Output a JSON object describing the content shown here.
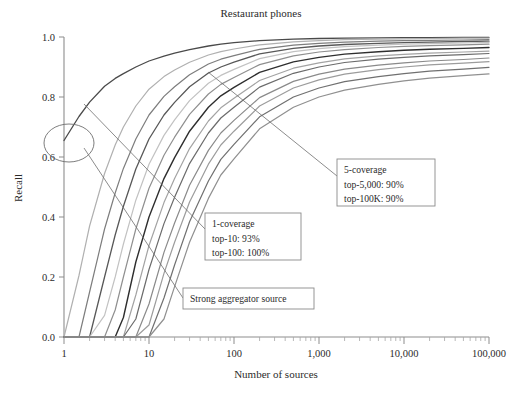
{
  "chart_data": {
    "type": "line",
    "title": "Restaurant phones",
    "xlabel": "Number of sources",
    "ylabel": "Recall",
    "xscale": "log",
    "xlim": [
      1,
      100000
    ],
    "ylim": [
      0.0,
      1.0
    ],
    "grid": false,
    "legend": "none",
    "xticks": [
      1,
      10,
      100,
      1000,
      10000,
      100000
    ],
    "xtick_labels": [
      "1",
      "10",
      "100",
      "1,000",
      "10,000",
      "100,000"
    ],
    "yticks": [
      0.0,
      0.2,
      0.4,
      0.6,
      0.8,
      1.0
    ],
    "ytick_labels": [
      "0.0",
      "0.2",
      "0.4",
      "0.6",
      "0.8",
      "1.0"
    ],
    "x": [
      1,
      1.5,
      2,
      3,
      4,
      5,
      7,
      10,
      15,
      20,
      30,
      50,
      70,
      100,
      200,
      500,
      1000,
      2000,
      5000,
      10000,
      20000,
      50000,
      100000
    ],
    "series": [
      {
        "name": "1-coverage",
        "color": "#4a4a4a",
        "width": 1.3,
        "values": [
          0.655,
          0.735,
          0.783,
          0.836,
          0.862,
          0.878,
          0.9,
          0.92,
          0.936,
          0.946,
          0.958,
          0.97,
          0.976,
          0.981,
          0.988,
          0.993,
          0.995,
          0.996,
          0.997,
          0.998,
          0.998,
          0.999,
          0.999
        ]
      },
      {
        "name": "2-coverage",
        "color": "#b0b0b0",
        "width": 1.2,
        "values": [
          0.0,
          0.205,
          0.37,
          0.545,
          0.64,
          0.7,
          0.77,
          0.826,
          0.868,
          0.89,
          0.916,
          0.94,
          0.951,
          0.96,
          0.974,
          0.984,
          0.988,
          0.991,
          0.993,
          0.994,
          0.995,
          0.996,
          0.996
        ]
      },
      {
        "name": "3-coverage",
        "color": "#7d7d7d",
        "width": 1.2,
        "values": [
          0.0,
          0.0,
          0.15,
          0.36,
          0.48,
          0.562,
          0.66,
          0.74,
          0.802,
          0.834,
          0.874,
          0.91,
          0.926,
          0.938,
          0.959,
          0.973,
          0.979,
          0.983,
          0.986,
          0.988,
          0.989,
          0.99,
          0.991
        ]
      },
      {
        "name": "4-coverage",
        "color": "#585858",
        "width": 1.3,
        "values": [
          0.0,
          0.0,
          0.0,
          0.2,
          0.34,
          0.436,
          0.56,
          0.66,
          0.74,
          0.782,
          0.834,
          0.88,
          0.9,
          0.916,
          0.944,
          0.962,
          0.97,
          0.975,
          0.979,
          0.981,
          0.983,
          0.985,
          0.986
        ]
      },
      {
        "name": "5-coverage",
        "color": "#c2c2c2",
        "width": 1.2,
        "values": [
          0.0,
          0.0,
          0.0,
          0.072,
          0.2,
          0.31,
          0.456,
          0.576,
          0.672,
          0.724,
          0.788,
          0.846,
          0.872,
          0.892,
          0.928,
          0.951,
          0.961,
          0.968,
          0.973,
          0.976,
          0.978,
          0.98,
          0.982
        ]
      },
      {
        "name": "6-coverage",
        "color": "#8f8f8f",
        "width": 1.2,
        "values": [
          0.0,
          0.0,
          0.0,
          0.0,
          0.09,
          0.2,
          0.36,
          0.496,
          0.606,
          0.666,
          0.742,
          0.81,
          0.842,
          0.865,
          0.908,
          0.937,
          0.95,
          0.958,
          0.965,
          0.969,
          0.971,
          0.974,
          0.976
        ]
      },
      {
        "name": "7-coverage",
        "color": "#2e2e2e",
        "width": 1.4,
        "values": [
          0.0,
          0.0,
          0.0,
          0.0,
          0.0,
          0.065,
          0.25,
          0.4,
          0.528,
          0.598,
          0.686,
          0.766,
          0.804,
          0.832,
          0.882,
          0.917,
          0.932,
          0.943,
          0.951,
          0.956,
          0.959,
          0.962,
          0.965
        ]
      },
      {
        "name": "8-coverage",
        "color": "#a3a3a3",
        "width": 1.2,
        "values": [
          0.0,
          0.0,
          0.0,
          0.0,
          0.0,
          0.0,
          0.14,
          0.305,
          0.448,
          0.528,
          0.628,
          0.72,
          0.764,
          0.796,
          0.855,
          0.896,
          0.914,
          0.927,
          0.937,
          0.942,
          0.946,
          0.95,
          0.953
        ]
      },
      {
        "name": "9-coverage",
        "color": "#6b6b6b",
        "width": 1.2,
        "values": [
          0.0,
          0.0,
          0.0,
          0.0,
          0.0,
          0.0,
          0.06,
          0.225,
          0.378,
          0.466,
          0.578,
          0.68,
          0.73,
          0.766,
          0.833,
          0.879,
          0.9,
          0.915,
          0.926,
          0.932,
          0.937,
          0.941,
          0.945
        ]
      },
      {
        "name": "10-coverage",
        "color": "#8a8a8a",
        "width": 1.2,
        "values": [
          0.0,
          0.0,
          0.0,
          0.0,
          0.0,
          0.0,
          0.0,
          0.11,
          0.282,
          0.38,
          0.506,
          0.622,
          0.68,
          0.722,
          0.798,
          0.852,
          0.876,
          0.893,
          0.906,
          0.914,
          0.92,
          0.925,
          0.93
        ]
      },
      {
        "name": "11-coverage",
        "color": "#9c9c9c",
        "width": 1.2,
        "values": [
          0.0,
          0.0,
          0.0,
          0.0,
          0.0,
          0.0,
          0.0,
          0.04,
          0.212,
          0.316,
          0.45,
          0.576,
          0.64,
          0.686,
          0.77,
          0.83,
          0.857,
          0.876,
          0.891,
          0.9,
          0.907,
          0.913,
          0.918
        ]
      },
      {
        "name": "12-coverage",
        "color": "#707070",
        "width": 1.2,
        "values": [
          0.0,
          0.0,
          0.0,
          0.0,
          0.0,
          0.0,
          0.0,
          0.0,
          0.13,
          0.24,
          0.384,
          0.52,
          0.592,
          0.642,
          0.734,
          0.8,
          0.83,
          0.851,
          0.868,
          0.878,
          0.886,
          0.893,
          0.899
        ]
      },
      {
        "name": "13-coverage",
        "color": "#909090",
        "width": 1.2,
        "values": [
          0.0,
          0.0,
          0.0,
          0.0,
          0.0,
          0.0,
          0.0,
          0.0,
          0.06,
          0.168,
          0.316,
          0.462,
          0.54,
          0.594,
          0.694,
          0.766,
          0.8,
          0.823,
          0.842,
          0.854,
          0.863,
          0.871,
          0.877
        ]
      }
    ],
    "annotations": [
      {
        "id": "one-coverage",
        "lines": [
          "1-coverage",
          "top-10: 93%",
          "top-100: 100%"
        ],
        "box": {
          "x": 205,
          "y": 213,
          "w": 96,
          "h": 47
        },
        "leader": {
          "x1": 205,
          "y1": 229,
          "x2": 84,
          "y2": 104
        }
      },
      {
        "id": "five-coverage",
        "lines": [
          "5-coverage",
          "top-5,000: 90%",
          "top-100K: 90%"
        ],
        "box": {
          "x": 337,
          "y": 159,
          "w": 98,
          "h": 47
        },
        "leader": {
          "x1": 337,
          "y1": 176,
          "x2": 208,
          "y2": 72
        }
      },
      {
        "id": "strong-aggregator-source",
        "lines": [
          "Strong aggregator source"
        ],
        "box": {
          "x": 183,
          "y": 288,
          "w": 131,
          "h": 21
        },
        "leader": {
          "x1": 183,
          "y1": 298,
          "x2": 84,
          "y2": 148
        }
      }
    ],
    "highlight_ellipse": {
      "cx": 69,
      "cy": 143,
      "rx": 25,
      "ry": 19,
      "note": "circled start of 1-coverage curve near recall 0.65 at 1 source"
    }
  }
}
